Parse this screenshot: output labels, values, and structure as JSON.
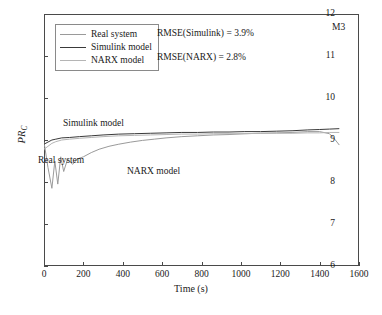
{
  "chart_data": {
    "type": "line",
    "title": "",
    "panel_id": "M3",
    "xlabel": "Time (s)",
    "ylabel": "PR_C",
    "ylabel_main": "PR",
    "ylabel_sub": "C",
    "xlim": [
      0,
      1600
    ],
    "ylim": [
      6,
      12
    ],
    "xticks": [
      0,
      200,
      400,
      600,
      800,
      1000,
      1200,
      1400,
      1600
    ],
    "yticks": [
      6,
      7,
      8,
      9,
      10,
      11,
      12
    ],
    "grid": false,
    "legend_position": "upper-left-inside",
    "annotations": [
      {
        "name": "rmse-simulink",
        "text": "RMSE(Simulink) = 3.9%"
      },
      {
        "name": "rmse-narx",
        "text": "RMSE(NARX) = 2.8%"
      },
      {
        "name": "panel-label",
        "text": "M3"
      },
      {
        "name": "curve-label-simulink",
        "text": "Simulink model"
      },
      {
        "name": "curve-label-real",
        "text": "Real system"
      },
      {
        "name": "curve-label-narx",
        "text": "NARX model"
      }
    ],
    "series": [
      {
        "name": "Real system",
        "color": "#9a9a9a",
        "x": [
          0,
          20,
          40,
          55,
          70,
          85,
          100,
          120,
          145,
          170,
          200,
          240,
          280,
          330,
          380,
          440,
          500,
          560,
          620,
          700,
          780,
          860,
          940,
          1020,
          1100,
          1180,
          1260,
          1340,
          1400,
          1450,
          1480,
          1500
        ],
        "y": [
          8.95,
          8.35,
          7.85,
          8.5,
          7.95,
          8.6,
          8.25,
          8.55,
          8.42,
          8.55,
          8.6,
          8.7,
          8.78,
          8.85,
          8.9,
          8.95,
          8.99,
          9.02,
          9.05,
          9.08,
          9.1,
          9.12,
          9.13,
          9.15,
          9.16,
          9.17,
          9.18,
          9.2,
          9.2,
          9.15,
          9.0,
          8.88
        ]
      },
      {
        "name": "Simulink model",
        "color": "#3a3a3a",
        "x": [
          0,
          20,
          40,
          60,
          90,
          130,
          180,
          240,
          300,
          380,
          460,
          540,
          620,
          700,
          780,
          860,
          940,
          1020,
          1100,
          1180,
          1260,
          1340,
          1400,
          1450,
          1500
        ],
        "y": [
          8.9,
          8.95,
          9.0,
          9.02,
          9.05,
          9.06,
          9.08,
          9.1,
          9.12,
          9.14,
          9.15,
          9.16,
          9.17,
          9.18,
          9.18,
          9.19,
          9.19,
          9.2,
          9.2,
          9.21,
          9.22,
          9.24,
          9.25,
          9.26,
          9.27
        ]
      },
      {
        "name": "NARX model",
        "color": "#b5b5b5",
        "x": [
          0,
          20,
          40,
          60,
          90,
          130,
          180,
          240,
          300,
          380,
          460,
          540,
          620,
          700,
          780,
          860,
          940,
          1020,
          1100,
          1180,
          1260,
          1340,
          1400,
          1450,
          1500
        ],
        "y": [
          8.78,
          8.85,
          8.92,
          8.96,
          9.0,
          9.02,
          9.04,
          9.06,
          9.08,
          9.1,
          9.11,
          9.12,
          9.13,
          9.14,
          9.14,
          9.15,
          9.15,
          9.15,
          9.16,
          9.16,
          9.16,
          9.17,
          9.17,
          9.18,
          9.18
        ]
      }
    ],
    "legend": [
      {
        "label": "Real system",
        "color": "#9a9a9a"
      },
      {
        "label": "Simulink model",
        "color": "#3a3a3a"
      },
      {
        "label": "NARX model",
        "color": "#b5b5b5"
      }
    ]
  }
}
